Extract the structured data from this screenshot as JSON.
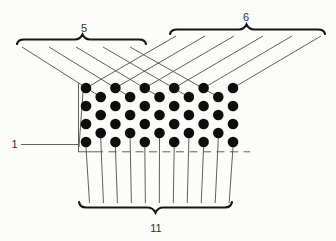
{
  "figure": {
    "background": "#fcfcfb",
    "ink_color": "#141414",
    "line_color": "#4d4d4d",
    "dot_color": "#0d0d0d",
    "labels": {
      "top_left": "5",
      "top_right": "6",
      "left": "1",
      "bottom": "11"
    },
    "array": {
      "columns": 11,
      "col_start_x": 86,
      "col_spacing": 14.7,
      "dot_radius": 5.3,
      "tall_row_ys": [
        88,
        106,
        124,
        142
      ],
      "short_row_ys": [
        97,
        115,
        133
      ]
    },
    "top_left_group": {
      "count": 5,
      "line_xs": [
        22,
        49,
        76,
        103,
        130
      ],
      "line_start_y": 47
    },
    "top_right_group": {
      "count": 6,
      "line_xs": [
        176,
        205,
        234,
        263,
        292,
        321
      ],
      "line_start_y": 36
    },
    "bottom_group": {
      "count": 11,
      "line_end_y": 203,
      "converge_x": 156,
      "converge_factor": 0.05,
      "tall_start_offset": 5,
      "short_start_offset": 5
    }
  }
}
